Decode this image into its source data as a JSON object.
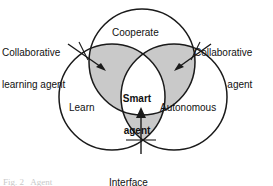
{
  "figure": {
    "caption": "Fig. 2   Agent"
  },
  "diagram": {
    "type": "venn-3-circle",
    "center_label_line1": "Smart",
    "center_label_line2": "agent",
    "shade_color": "#c9c9c9",
    "stroke_color": "#1a1a1a",
    "background_color": "#ffffff",
    "circles": [
      {
        "id": "cooperate",
        "label": "Cooperate",
        "cx": 142,
        "cy": 62,
        "r": 53
      },
      {
        "id": "learn",
        "label": "Learn",
        "cx": 112,
        "cy": 97,
        "r": 53
      },
      {
        "id": "autonomous",
        "label": "Autonomous",
        "cx": 174,
        "cy": 97,
        "r": 53
      }
    ],
    "callouts": [
      {
        "id": "collaborative-learning-agent",
        "line1": "Collaborative",
        "line2": "learning agent",
        "target": "cooperate ∩ learn"
      },
      {
        "id": "collaborative-agent",
        "line1": "Collaborative",
        "line2": "agent",
        "target": "cooperate ∩ autonomous"
      },
      {
        "id": "interface-agent",
        "line1": "Interface",
        "line2": "agent",
        "target": "learn ∩ autonomous"
      }
    ]
  }
}
